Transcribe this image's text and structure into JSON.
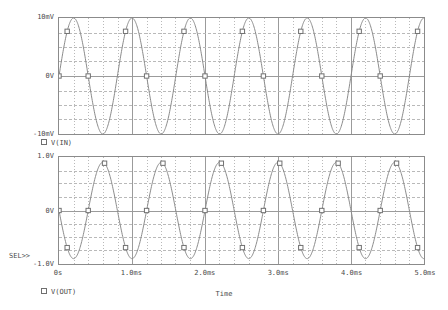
{
  "app": {
    "title": "Probe Waveform Display"
  },
  "plots": [
    {
      "id": "plot-vin",
      "trace_name": "V(IN)",
      "legend_marker": "square-marker-icon",
      "y_axis": {
        "top_label": "10mV",
        "mid_label": "0V",
        "bottom_label": "-10mV",
        "min": -10,
        "max": 10,
        "unit": "mV"
      },
      "selected": false
    },
    {
      "id": "plot-vout",
      "trace_name": "V(OUT)",
      "legend_marker": "square-marker-icon",
      "y_axis": {
        "top_label": "1.0V",
        "mid_label": "0V",
        "bottom_label": "-1.0V",
        "min": -1.0,
        "max": 1.0,
        "unit": "V"
      },
      "selected": true,
      "select_indicator": "SEL>>"
    }
  ],
  "x_axis": {
    "title": "Time",
    "tick_labels": [
      "0s",
      "1.0ms",
      "2.0ms",
      "3.0ms",
      "4.0ms",
      "5.0ms"
    ],
    "min": 0,
    "max": 5.0,
    "unit": "ms"
  },
  "colors": {
    "trace": "#8a8a8a",
    "frame": "#8b8b8b",
    "grid_major": "#9a9a9a",
    "grid_minor": "#b8b8b8",
    "text": "#4a4a4a",
    "background": "#ffffff"
  },
  "chart_data": {
    "type": "line",
    "title": "",
    "xlabel": "Time",
    "ylabel": "",
    "grid": true,
    "legend": "below-each-plot",
    "xlim": [
      0,
      5.0
    ],
    "x_unit": "ms",
    "panels": [
      {
        "name": "V(IN)",
        "ylabel": "",
        "ylim": [
          -10,
          10
        ],
        "y_unit": "mV",
        "yticks": [
          -10,
          0,
          10
        ],
        "waveform": "sine",
        "amplitude": 10,
        "frequency_khz": 1.25,
        "phase_deg": 0,
        "offset": 0,
        "cycles": 6.25,
        "series": [
          {
            "name": "V(IN)",
            "x": [
              0,
              0.1,
              0.2,
              0.3,
              0.4,
              0.5,
              0.6,
              0.7,
              0.8,
              0.9,
              1.0,
              1.1,
              1.2,
              1.3,
              1.4,
              1.5,
              1.6,
              1.7,
              1.8,
              1.9,
              2.0,
              2.1,
              2.2,
              2.3,
              2.4,
              2.5,
              2.6,
              2.7,
              2.8,
              2.9,
              3.0,
              3.1,
              3.2,
              3.3,
              3.4,
              3.5,
              3.6,
              3.7,
              3.8,
              3.9,
              4.0,
              4.1,
              4.2,
              4.3,
              4.4,
              4.5,
              4.6,
              4.7,
              4.8,
              4.9,
              5.0
            ],
            "y": [
              0.0,
              7.07,
              10.0,
              7.07,
              0.0,
              -7.07,
              -10.0,
              -7.07,
              0.0,
              7.07,
              10.0,
              7.07,
              0.0,
              -7.07,
              -10.0,
              -7.07,
              0.0,
              7.07,
              10.0,
              7.07,
              0.0,
              -7.07,
              -10.0,
              -7.07,
              0.0,
              7.07,
              10.0,
              7.07,
              0.0,
              -7.07,
              -10.0,
              -7.07,
              0.0,
              7.07,
              10.0,
              7.07,
              0.0,
              -7.07,
              -10.0,
              -7.07,
              0.0,
              7.07,
              10.0,
              7.07,
              0.0,
              -7.07,
              -10.0,
              -7.07,
              0.0,
              7.07,
              10.0
            ]
          }
        ]
      },
      {
        "name": "V(OUT)",
        "ylabel": "",
        "ylim": [
          -1.0,
          1.0
        ],
        "y_unit": "V",
        "yticks": [
          -1.0,
          0,
          1.0
        ],
        "waveform": "sine-inverted",
        "amplitude": 0.9,
        "frequency_khz": 1.25,
        "phase_deg": 180,
        "offset": 0,
        "cycles": 6.25,
        "series": [
          {
            "name": "V(OUT)",
            "x": [
              0,
              0.1,
              0.2,
              0.3,
              0.4,
              0.5,
              0.6,
              0.7,
              0.8,
              0.9,
              1.0,
              1.1,
              1.2,
              1.3,
              1.4,
              1.5,
              1.6,
              1.7,
              1.8,
              1.9,
              2.0,
              2.1,
              2.2,
              2.3,
              2.4,
              2.5,
              2.6,
              2.7,
              2.8,
              2.9,
              3.0,
              3.1,
              3.2,
              3.3,
              3.4,
              3.5,
              3.6,
              3.7,
              3.8,
              3.9,
              4.0,
              4.1,
              4.2,
              4.3,
              4.4,
              4.5,
              4.6,
              4.7,
              4.8,
              4.9,
              5.0
            ],
            "y": [
              0.0,
              -0.636,
              -0.9,
              -0.636,
              0.0,
              0.636,
              0.9,
              0.636,
              0.0,
              -0.636,
              -0.9,
              -0.636,
              0.0,
              0.636,
              0.9,
              0.636,
              0.0,
              -0.636,
              -0.9,
              -0.636,
              0.0,
              0.636,
              0.9,
              0.636,
              0.0,
              -0.636,
              -0.9,
              -0.636,
              0.0,
              0.636,
              0.9,
              0.636,
              0.0,
              -0.636,
              -0.9,
              -0.636,
              0.0,
              0.636,
              0.9,
              0.636,
              0.0,
              -0.636,
              -0.9,
              -0.636,
              0.0,
              0.636,
              0.9,
              0.636,
              0.0,
              -0.636,
              -0.9
            ]
          }
        ]
      }
    ]
  }
}
